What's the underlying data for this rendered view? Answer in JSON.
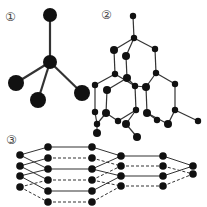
{
  "figure": {
    "labels": [
      "①",
      "②",
      "③"
    ],
    "panels": [
      {
        "id": "1",
        "label": "①",
        "description": "tetrahedral molecule (central atom bonded to four atoms)"
      },
      {
        "id": "2",
        "label": "②",
        "description": "diamond-like 3D lattice"
      },
      {
        "id": "3",
        "label": "③",
        "description": "graphite-like stacked hexagonal layers"
      }
    ],
    "colors": {
      "atom": "#111111",
      "bond": "#333333",
      "background": "#ffffff"
    }
  }
}
